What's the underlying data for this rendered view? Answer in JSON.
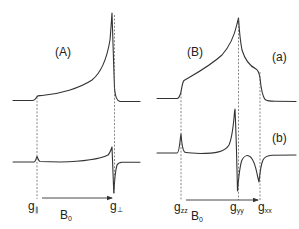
{
  "colors": {
    "line": "#333333",
    "guide": "#555555",
    "text": "#222222",
    "background": "#ffffff"
  },
  "panels": [
    {
      "id": "A",
      "label": "(A)",
      "description": "Axially symmetric EPR powder pattern: absorption (top) and first-derivative (bottom)",
      "field_label": "B",
      "field_sub": "0",
      "g_markers": [
        {
          "symbol": "g",
          "sub": "∥",
          "name": "g-parallel"
        },
        {
          "symbol": "g",
          "sub": "⊥",
          "name": "g-perpendicular"
        }
      ]
    },
    {
      "id": "B",
      "label": "(B)",
      "description": "Rhombic EPR powder pattern: (a) absorption, (b) first-derivative",
      "traces": [
        {
          "label": "(a)"
        },
        {
          "label": "(b)"
        }
      ],
      "field_label": "B",
      "field_sub": "0",
      "g_markers": [
        {
          "symbol": "g",
          "sub": "zz",
          "name": "g-zz"
        },
        {
          "symbol": "g",
          "sub": "yy",
          "name": "g-yy"
        },
        {
          "symbol": "g",
          "sub": "xx",
          "name": "g-xx"
        }
      ]
    }
  ]
}
